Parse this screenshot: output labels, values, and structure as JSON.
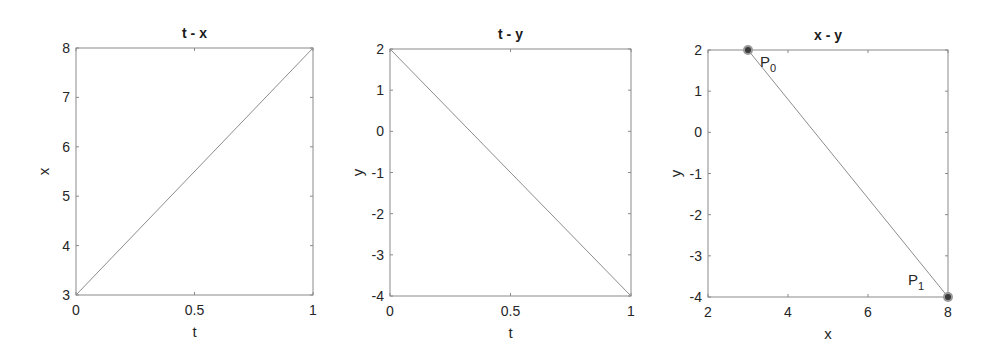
{
  "chart_data": [
    {
      "type": "line",
      "title": "t - x",
      "xlabel": "t",
      "ylabel": "x",
      "xlim": [
        0,
        1
      ],
      "ylim": [
        3,
        8
      ],
      "xticks": [
        0,
        0.5,
        1
      ],
      "xtick_labels": [
        "0",
        "0.5",
        "1"
      ],
      "yticks": [
        3,
        4,
        5,
        6,
        7,
        8
      ],
      "ytick_labels": [
        "3",
        "4",
        "5",
        "6",
        "7",
        "8"
      ],
      "grid": false,
      "series": [
        {
          "name": "x(t)",
          "x": [
            0,
            1
          ],
          "y": [
            3,
            8
          ]
        }
      ]
    },
    {
      "type": "line",
      "title": "t - y",
      "xlabel": "t",
      "ylabel": "y",
      "xlim": [
        0,
        1
      ],
      "ylim": [
        -4,
        2
      ],
      "xticks": [
        0,
        0.5,
        1
      ],
      "xtick_labels": [
        "0",
        "0.5",
        "1"
      ],
      "yticks": [
        -4,
        -3,
        -2,
        -1,
        0,
        1,
        2
      ],
      "ytick_labels": [
        "-4",
        "-3",
        "-2",
        "-1",
        "0",
        "1",
        "2"
      ],
      "grid": false,
      "series": [
        {
          "name": "y(t)",
          "x": [
            0,
            1
          ],
          "y": [
            2,
            -4
          ]
        }
      ]
    },
    {
      "type": "line",
      "title": "x - y",
      "xlabel": "x",
      "ylabel": "y",
      "xlim": [
        2,
        8
      ],
      "ylim": [
        -4,
        2
      ],
      "xticks": [
        2,
        4,
        6,
        8
      ],
      "xtick_labels": [
        "2",
        "4",
        "6",
        "8"
      ],
      "yticks": [
        -4,
        -3,
        -2,
        -1,
        0,
        1,
        2
      ],
      "ytick_labels": [
        "-4",
        "-3",
        "-2",
        "-1",
        "0",
        "1",
        "2"
      ],
      "grid": false,
      "series": [
        {
          "name": "path",
          "x": [
            3,
            8
          ],
          "y": [
            2,
            -4
          ]
        }
      ],
      "points": [
        {
          "label": "P",
          "subscript": "0",
          "x": 3,
          "y": 2
        },
        {
          "label": "P",
          "subscript": "1",
          "x": 8,
          "y": -4
        }
      ]
    }
  ],
  "colors": {
    "axes": "#8a8a8a",
    "line": "#8c8c8c",
    "marker": "#3a3a3a",
    "text": "#262626"
  }
}
